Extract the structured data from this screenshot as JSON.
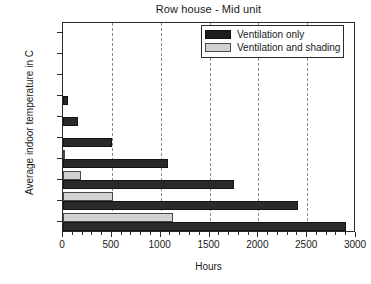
{
  "chart_data": {
    "type": "bar",
    "orientation": "horizontal",
    "title": "Row house - Mid unit",
    "xlabel": "Hours",
    "ylabel": "Average indoor temperature in C",
    "categories": [
      "> 31",
      "> 30",
      "> 29",
      "> 28",
      "> 27",
      "> 26",
      "> 25",
      "> 24",
      "> 23",
      "> 22"
    ],
    "series": [
      {
        "name": "Ventilation only",
        "color": "#2a2a2a",
        "values": [
          0,
          0,
          0,
          50,
          150,
          500,
          1070,
          1750,
          2410,
          2900
        ]
      },
      {
        "name": "Ventilation and shading",
        "color": "#d2d2d2",
        "values": [
          0,
          0,
          0,
          0,
          0,
          0,
          20,
          180,
          510,
          1130
        ]
      }
    ],
    "xlim": [
      0,
      3000
    ],
    "xticks": [
      0,
      500,
      1000,
      1500,
      2000,
      2500,
      3000
    ],
    "xtick_labels": [
      "0",
      "500",
      "1000",
      "1500",
      "2000",
      "2500",
      "3000"
    ],
    "xminor_step": 100,
    "gridlines": [
      500,
      1000,
      1500,
      2000,
      2500
    ],
    "grid": true,
    "legend_position": "top-right"
  }
}
